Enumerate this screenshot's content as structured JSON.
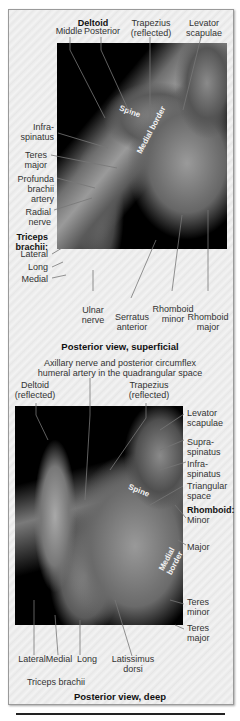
{
  "figure": {
    "top_panel": {
      "caption": "Posterior view, superficial",
      "labels": {
        "deltoid_heading": "Deltoid",
        "deltoid_middle": "Middle",
        "deltoid_posterior": "Posterior",
        "trapezius": "Trapezius",
        "trapezius_sub": "(reflected)",
        "levator": "Levator",
        "levator_sub": "scapulae",
        "infraspinatus_1": "Infra-",
        "infraspinatus_2": "spinatus",
        "teres_major_1": "Teres",
        "teres_major_2": "major",
        "profunda_1": "Profunda",
        "profunda_2": "brachii",
        "profunda_3": "artery",
        "radial_1": "Radial",
        "radial_2": "nerve",
        "triceps_1": "Triceps",
        "triceps_2": "brachii:",
        "lateral": "Lateral",
        "long": "Long",
        "medial": "Medial",
        "ulnar_1": "Ulnar",
        "ulnar_2": "nerve",
        "serratus_1": "Serratus",
        "serratus_2": "anterior",
        "rhomboid_minor_1": "Rhomboid",
        "rhomboid_minor_2": "minor",
        "rhomboid_major_1": "Rhomboid",
        "rhomboid_major_2": "major",
        "spine": "Spine",
        "medial_border": "Medial border"
      }
    },
    "bottom_panel": {
      "caption": "Posterior view, deep",
      "labels": {
        "axillary_1": "Axillary nerve and posterior circumflex",
        "axillary_2": "humeral artery in the quadrangular space",
        "deltoid": "Deltoid",
        "deltoid_sub": "(reflected)",
        "trapezius": "Trapezius",
        "trapezius_sub": "(reflected)",
        "levator_1": "Levator",
        "levator_2": "scapulae",
        "supra_1": "Supra-",
        "supra_2": "spinatus",
        "infra_1": "Infra-",
        "infra_2": "spinatus",
        "triangular_1": "Triangular",
        "triangular_2": "space",
        "rhomboid_heading": "Rhomboid:",
        "rhomboid_minor": "Minor",
        "rhomboid_major": "Major",
        "teres_minor_1": "Teres",
        "teres_minor_2": "minor",
        "teres_major_1": "Teres",
        "teres_major_2": "major",
        "lateral": "Lateral",
        "medial": "Medial",
        "long": "Long",
        "latissimus_1": "Latissimus",
        "latissimus_2": "dorsi",
        "triceps": "Triceps brachii",
        "spine": "Spine",
        "medial_border": "Medial border"
      }
    }
  }
}
